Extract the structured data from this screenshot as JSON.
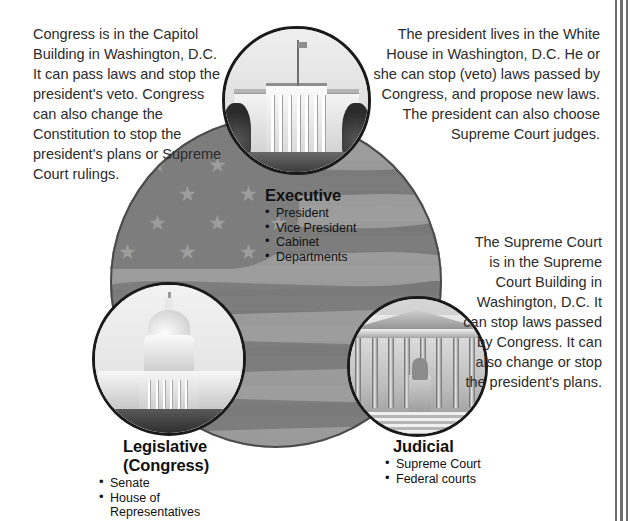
{
  "page": {
    "title": "Three Branches of the U.S. Government"
  },
  "descriptions": {
    "legislative": "Congress is in the Capitol Building in Washington, D.C. It can pass laws and stop the president's veto. Congress can also change the Constitution to stop the president's plans or Supreme Court rulings.",
    "executive": "The president lives in the White House in Washington, D.C.  He or she can stop (veto) laws passed by Congress, and propose new laws. The president can also choose Supreme Court judges.",
    "judicial": "The Supreme Court is in the Supreme Court Building in Washington, D.C. It can stop laws passed by Congress.  It can also change or stop the president's plans."
  },
  "branches": {
    "executive": {
      "heading": "Executive",
      "items": [
        "President",
        "Vice President",
        "Cabinet",
        "Departments"
      ]
    },
    "legislative": {
      "heading_line1": "Legislative",
      "heading_line2": "(Congress)",
      "items": [
        "Senate",
        "House of Representatives"
      ]
    },
    "judicial": {
      "heading": "Judicial",
      "items": [
        "Supreme Court",
        "Federal courts"
      ]
    }
  },
  "photos": {
    "white_house": "white-house-photo",
    "capitol": "capitol-building-photo",
    "supreme_court": "supreme-court-building-photo"
  },
  "colors": {
    "flag_field": "#7d7d7d",
    "flag_star": "#9d9d9d",
    "stripe_light": "#9d9d9d",
    "stripe_dark": "#7b7b7b",
    "text": "#2b2b2b",
    "rule": "#6d6d6d"
  }
}
